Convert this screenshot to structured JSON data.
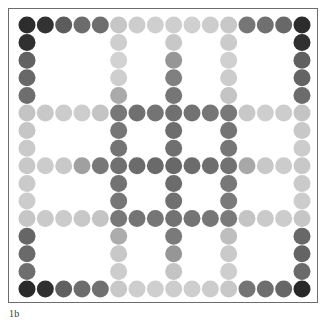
{
  "figure": {
    "caption": "1b",
    "frame_color": "#6b6b70",
    "background_color": "#ffffff",
    "width": 332,
    "height": 325
  },
  "chart_data": {
    "type": "scatter",
    "title": "",
    "subtitle": "",
    "xlabel": "",
    "ylabel": "",
    "grid": false,
    "legend_position": "none",
    "annotations": [
      "1b"
    ],
    "marker": "circle",
    "marker_diameter_px": 17,
    "grid_cols": 16,
    "grid_rows": 16,
    "line_indices": [
      0,
      5,
      8,
      11,
      15
    ],
    "x": [
      0,
      1,
      2,
      3,
      4,
      5,
      6,
      7,
      8,
      9,
      10,
      11,
      12,
      13,
      14,
      15
    ],
    "y": [
      0,
      1,
      2,
      3,
      4,
      5,
      6,
      7,
      8,
      9,
      10,
      11,
      12,
      13,
      14,
      15
    ],
    "xlim": [
      0,
      15
    ],
    "ylim": [
      0,
      15
    ],
    "value_range": [
      0,
      255
    ],
    "colormap": "grayscale",
    "values": [
      [
        45,
        50,
        92,
        108,
        110,
        198,
        205,
        207,
        206,
        208,
        205,
        200,
        118,
        112,
        104,
        44
      ],
      [
        48,
        null,
        null,
        null,
        null,
        206,
        null,
        null,
        200,
        null,
        null,
        203,
        null,
        null,
        null,
        48
      ],
      [
        98,
        null,
        null,
        null,
        null,
        210,
        null,
        null,
        150,
        null,
        null,
        208,
        null,
        null,
        null,
        96
      ],
      [
        104,
        null,
        null,
        null,
        null,
        206,
        null,
        null,
        128,
        null,
        null,
        204,
        null,
        null,
        null,
        100
      ],
      [
        110,
        null,
        null,
        null,
        null,
        170,
        null,
        null,
        118,
        null,
        null,
        196,
        null,
        null,
        null,
        108
      ],
      [
        196,
        200,
        204,
        205,
        196,
        120,
        112,
        116,
        112,
        114,
        118,
        120,
        200,
        206,
        205,
        196
      ],
      [
        198,
        null,
        null,
        null,
        null,
        118,
        null,
        null,
        110,
        null,
        null,
        116,
        null,
        null,
        null,
        200
      ],
      [
        202,
        null,
        null,
        null,
        null,
        116,
        null,
        null,
        112,
        null,
        null,
        118,
        null,
        null,
        null,
        204
      ],
      [
        200,
        204,
        200,
        160,
        120,
        112,
        108,
        106,
        104,
        108,
        110,
        114,
        168,
        200,
        204,
        200
      ],
      [
        202,
        null,
        null,
        null,
        null,
        114,
        null,
        null,
        108,
        null,
        null,
        120,
        null,
        null,
        null,
        202
      ],
      [
        204,
        null,
        null,
        null,
        null,
        118,
        null,
        null,
        112,
        null,
        null,
        122,
        null,
        null,
        null,
        204
      ],
      [
        198,
        202,
        203,
        200,
        196,
        120,
        116,
        118,
        114,
        116,
        118,
        122,
        196,
        202,
        204,
        198
      ],
      [
        102,
        null,
        null,
        null,
        null,
        172,
        null,
        null,
        122,
        null,
        null,
        190,
        null,
        null,
        null,
        104
      ],
      [
        106,
        null,
        null,
        null,
        null,
        200,
        null,
        null,
        150,
        null,
        null,
        202,
        null,
        null,
        null,
        100
      ],
      [
        110,
        null,
        null,
        null,
        null,
        204,
        null,
        null,
        196,
        null,
        null,
        206,
        null,
        null,
        null,
        106
      ],
      [
        42,
        48,
        96,
        108,
        112,
        200,
        206,
        207,
        205,
        206,
        204,
        200,
        116,
        110,
        102,
        40
      ]
    ]
  }
}
